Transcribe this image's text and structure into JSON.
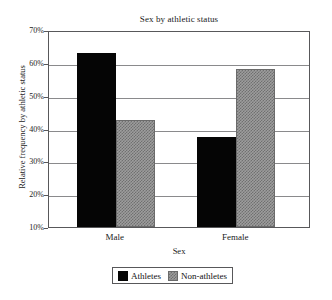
{
  "chart_data": {
    "type": "bar",
    "title": "Sex by athletic status",
    "xlabel": "Sex",
    "ylabel": "Relative frequency by athletic status",
    "categories": [
      "Male",
      "Female"
    ],
    "series": [
      {
        "name": "Athletes",
        "color": "#050505",
        "values": [
          63.0,
          37.5
        ]
      },
      {
        "name": "Non-athletes",
        "color": "#9d9d9d",
        "values": [
          42.5,
          58.0
        ]
      }
    ],
    "ylim": [
      10,
      70
    ],
    "ytick_values": [
      70,
      60,
      50,
      40,
      30,
      20,
      10
    ],
    "ytick_labels": [
      "70%",
      "60%",
      "50%",
      "40%",
      "30%",
      "20%",
      "10%"
    ],
    "grid": true,
    "legend_position": "bottom-center"
  },
  "legend": {
    "entries": [
      {
        "label": "Athletes",
        "swatch": "black-solid-swatch"
      },
      {
        "label": "Non-athletes",
        "swatch": "gray-hatched-swatch"
      }
    ]
  }
}
